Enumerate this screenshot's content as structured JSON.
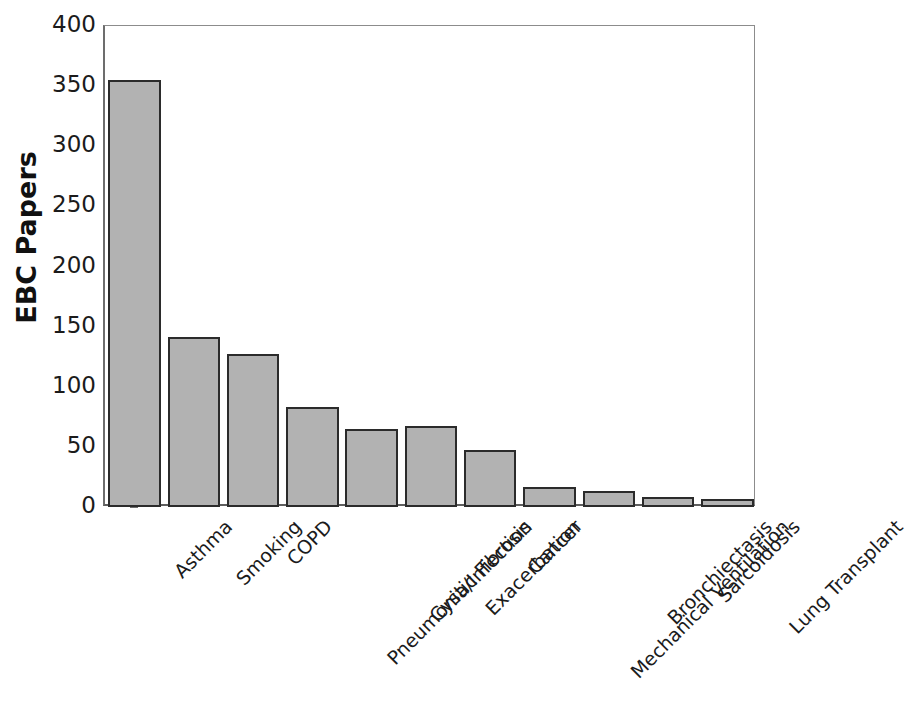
{
  "chart_data": {
    "type": "bar",
    "title": "",
    "xlabel": "",
    "ylabel": "EBC Papers",
    "ylim": [
      0,
      400
    ],
    "yticks": [
      0,
      50,
      100,
      150,
      200,
      250,
      300,
      350,
      400
    ],
    "ytick_labels": [
      "0",
      "50",
      "100",
      "150",
      "200",
      "250",
      "300",
      "350",
      "400"
    ],
    "grid": false,
    "legend": "none",
    "bar_color": "#b2b2b2",
    "bar_edge_color": "#2b2b2b",
    "categories": [
      "Asthma",
      "Smoking",
      "COPD",
      "Pneumonia/Infection",
      "Cystic Fibrosis",
      "Exacerbation",
      "Cancer",
      "Mechanical Ventilation",
      "Bronchiectasis",
      "Sarcoidosis",
      "Lung Transplant"
    ],
    "values": [
      355,
      141,
      127,
      83,
      65,
      67,
      47,
      17,
      13,
      8,
      7
    ]
  },
  "axes": {
    "y_title": "EBC Papers"
  }
}
